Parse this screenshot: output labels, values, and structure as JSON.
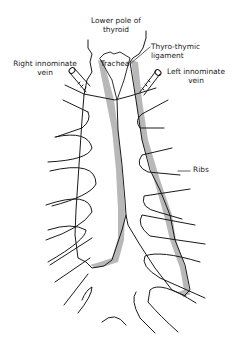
{
  "diagram": {
    "labels": {
      "lower_pole": {
        "line1": "Lower pole of",
        "line2": "thyroid"
      },
      "trachea": "Trachea",
      "thyro_thymic": {
        "line1": "Thyro-thymic",
        "line2": "ligament"
      },
      "right_innominate": {
        "line1": "Right innominate",
        "line2": "vein"
      },
      "left_innominate": {
        "line1": "Left innominate",
        "line2": "vein"
      },
      "ribs": "Ribs"
    },
    "colors": {
      "line": "#1a1a1a",
      "shading": "#b8b8b8",
      "background": "#ffffff"
    }
  }
}
